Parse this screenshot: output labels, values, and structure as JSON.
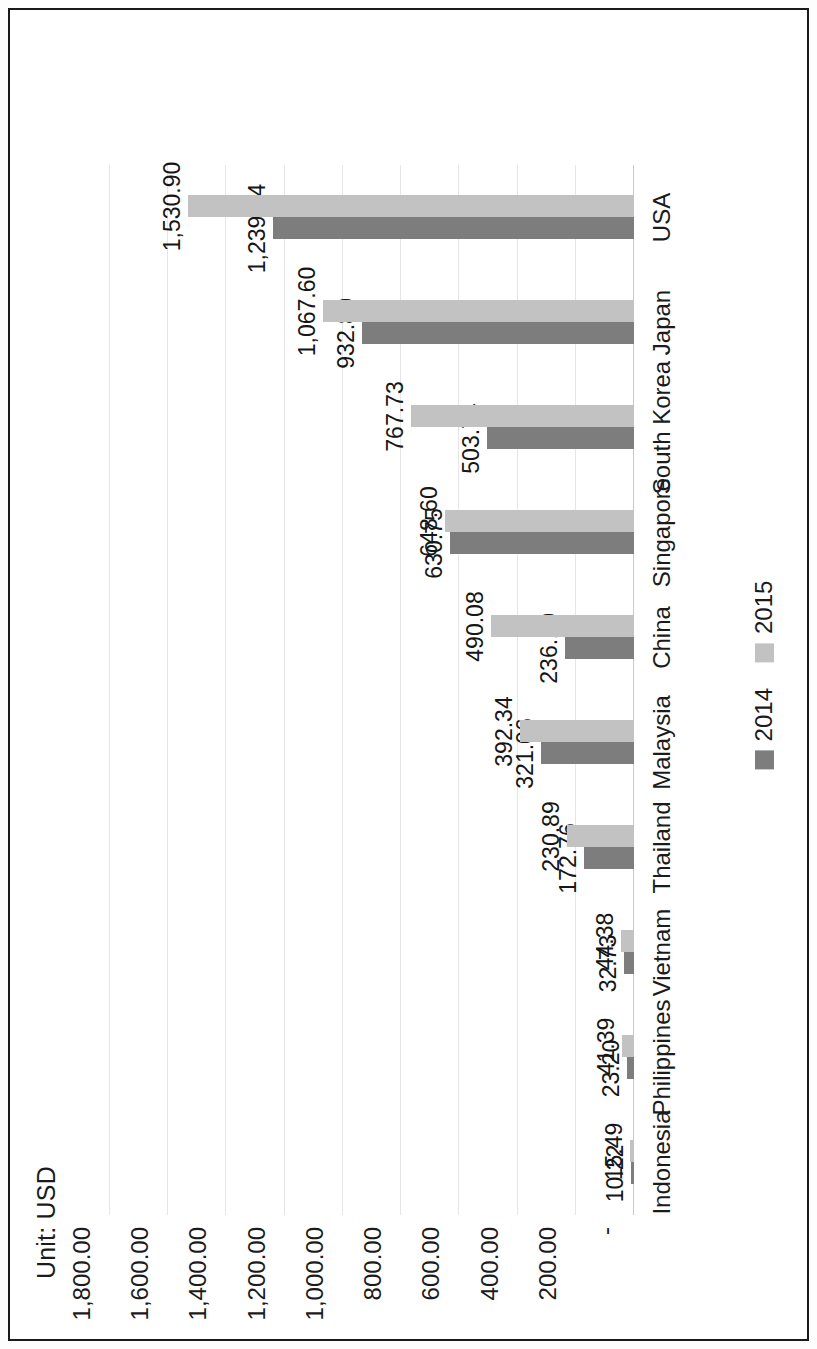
{
  "chart_title": "Unit: USD",
  "legend": {
    "items": [
      {
        "label": "2014",
        "color": "#7d7d7d"
      },
      {
        "label": "2015",
        "color": "#c2c2c2"
      }
    ]
  },
  "axis": {
    "zero_label": "-",
    "tick_labels": [
      "-",
      "200.00",
      "400.00",
      "600.00",
      "800.00",
      "1,000.00",
      "1,200.00",
      "1,400.00",
      "1,600.00",
      "1,800.00"
    ]
  },
  "chart_data": {
    "type": "bar",
    "title": "Unit: USD",
    "xlabel": "",
    "ylabel": "",
    "ylim": [
      0,
      1800
    ],
    "grid": true,
    "legend_position": "bottom",
    "orientation": "vertical-bars-page-rotated-90",
    "categories": [
      "Indonesia",
      "Philippines",
      "Vietnam",
      "Thailand",
      "Malaysia",
      "China",
      "Singapore",
      "South Korea",
      "Japan",
      "USA"
    ],
    "tick_values": [
      0,
      200,
      400,
      600,
      800,
      1000,
      1200,
      1400,
      1600,
      1800
    ],
    "tick_labels": [
      "-",
      "200.00",
      "400.00",
      "600.00",
      "800.00",
      "1,000.00",
      "1,200.00",
      "1,400.00",
      "1,600.00",
      "1,800.00"
    ],
    "series": [
      {
        "name": "2014",
        "color": "#7d7d7d",
        "values": [
          10.22,
          23.2,
          32.73,
          172.76,
          321.06,
          236.1,
          630.75,
          503.74,
          932.8,
          1239.74
        ],
        "labels": [
          "10.22",
          "23.20",
          "32.73",
          "172.76",
          "321.06",
          "236.10",
          "630.75",
          "503.74",
          "932.80",
          "1,239.74"
        ]
      },
      {
        "name": "2015",
        "color": "#c2c2c2",
        "values": [
          15.49,
          41.39,
          44.38,
          230.89,
          392.34,
          490.08,
          648.6,
          767.73,
          1067.6,
          1530.9
        ],
        "labels": [
          "15.49",
          "41.39",
          "44.38",
          "230.89",
          "392.34",
          "490.08",
          "648.60",
          "767.73",
          "1,067.60",
          "1,530.90"
        ]
      }
    ]
  }
}
